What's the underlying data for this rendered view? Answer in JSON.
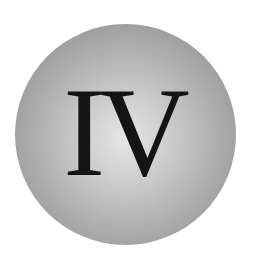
{
  "badge": {
    "numeral": "IV",
    "colors": {
      "sphere_highlight": "#e6e6e6",
      "sphere_shadow": "#8a8a8a",
      "text": "#141414",
      "background": "#ffffff"
    }
  }
}
